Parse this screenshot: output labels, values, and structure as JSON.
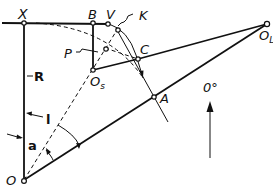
{
  "diagram": {
    "type": "geometric-construction",
    "points": {
      "X": "X",
      "B": "B",
      "V": "V",
      "K": "K",
      "P": "P",
      "C": "C",
      "Os": "O",
      "Os_sub": "s",
      "OL": "O",
      "OL_sub": "L",
      "A": "A",
      "O": "O"
    },
    "dimensions": {
      "R": "R",
      "l": "l",
      "a": "a"
    },
    "direction_label": "0°",
    "colors": {
      "ink": "#111111",
      "background": "#ffffff"
    }
  }
}
